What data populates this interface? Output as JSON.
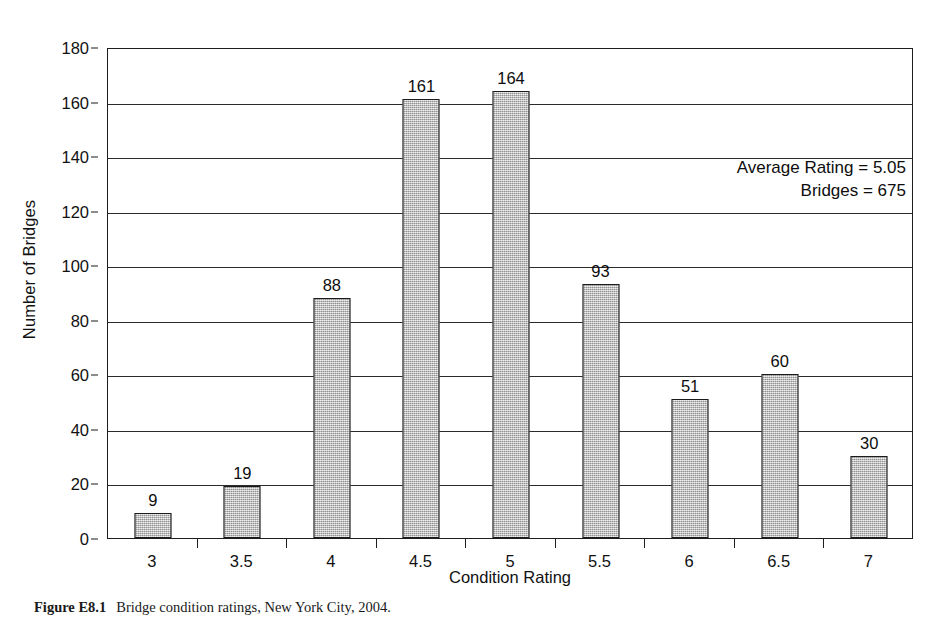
{
  "chart_data": {
    "type": "bar",
    "title": "",
    "categories": [
      "3",
      "3.5",
      "4",
      "4.5",
      "5",
      "5.5",
      "6",
      "6.5",
      "7"
    ],
    "values": [
      9,
      19,
      88,
      161,
      164,
      93,
      51,
      60,
      30
    ],
    "xlabel": "Condition Rating",
    "ylabel": "Number of Bridges",
    "ylim": [
      0,
      180
    ],
    "ytick_values": [
      0,
      20,
      40,
      60,
      80,
      100,
      120,
      140,
      160,
      180
    ],
    "ytick_labels": [
      "0",
      "20",
      "40",
      "60",
      "80",
      "100",
      "120",
      "140",
      "160",
      "180"
    ],
    "grid": "horizontal",
    "legend": "none",
    "bar_labels": [
      "9",
      "19",
      "88",
      "161",
      "164",
      "93",
      "51",
      "60",
      "30"
    ],
    "bar_fill": "#b4b4b4",
    "bar_edge": "#1b1b1b",
    "annotations": [
      "Average Rating = 5.05",
      "Bridges = 675"
    ]
  },
  "annotation": {
    "average_rating_line": "Average Rating = 5.05",
    "bridges_line": "Bridges = 675"
  },
  "caption": {
    "label": "Figure E8.1",
    "text": "Bridge condition ratings, New York City, 2004."
  }
}
